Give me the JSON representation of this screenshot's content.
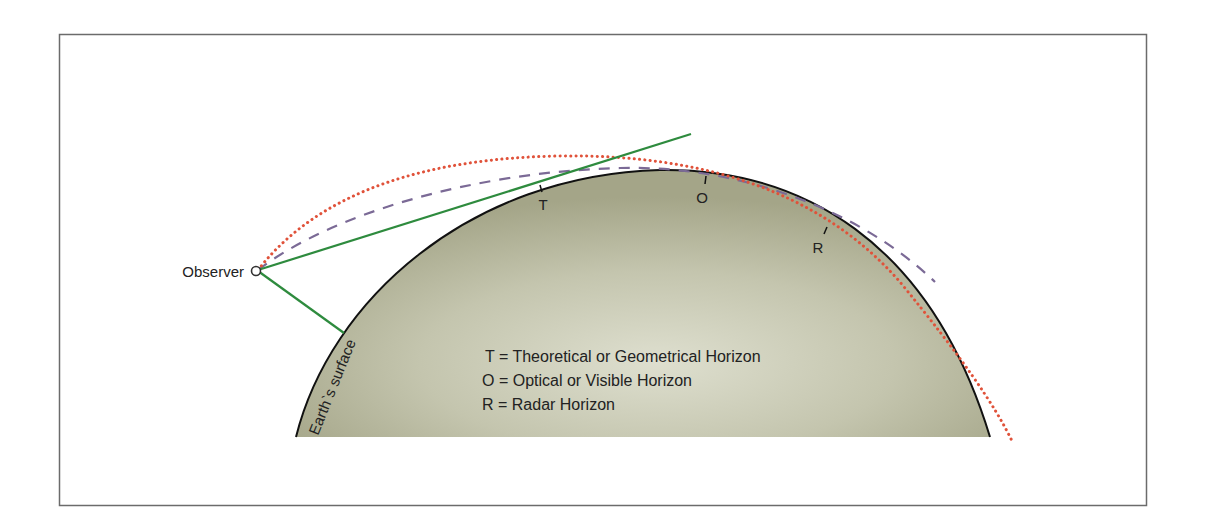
{
  "diagram": {
    "type": "horizon-geometry",
    "frame": {
      "x": 59,
      "y": 34,
      "width": 1087,
      "height": 471,
      "stroke": "#6b6b6b"
    },
    "earth": {
      "label": "Earth`s surface",
      "fill_center": "#dadbcb",
      "fill_edge": "#a6a78b",
      "outline": "#111111"
    },
    "observer": {
      "label": "Observer",
      "x": 256,
      "y": 271
    },
    "markers": {
      "T": {
        "label": "T",
        "x": 541,
        "y": 205
      },
      "O": {
        "label": "O",
        "x": 703,
        "y": 198
      },
      "R": {
        "label": "R",
        "x": 818,
        "y": 248
      }
    },
    "lines": {
      "geometric_tangent": {
        "name": "Line of sight (tangent)",
        "color": "#2e8b3e",
        "style": "solid"
      },
      "ground_line": {
        "name": "Line to surface",
        "color": "#2e8b3e",
        "style": "solid"
      },
      "radar_path": {
        "name": "Radar ray path",
        "color": "#e0523a",
        "style": "dotted"
      },
      "optical_path": {
        "name": "Optical ray path",
        "color": "#7b6a96",
        "style": "dashed"
      }
    },
    "legend": [
      "T = Theoretical or Geometrical Horizon",
      "O = Optical or Visible Horizon",
      "R = Radar Horizon"
    ]
  }
}
